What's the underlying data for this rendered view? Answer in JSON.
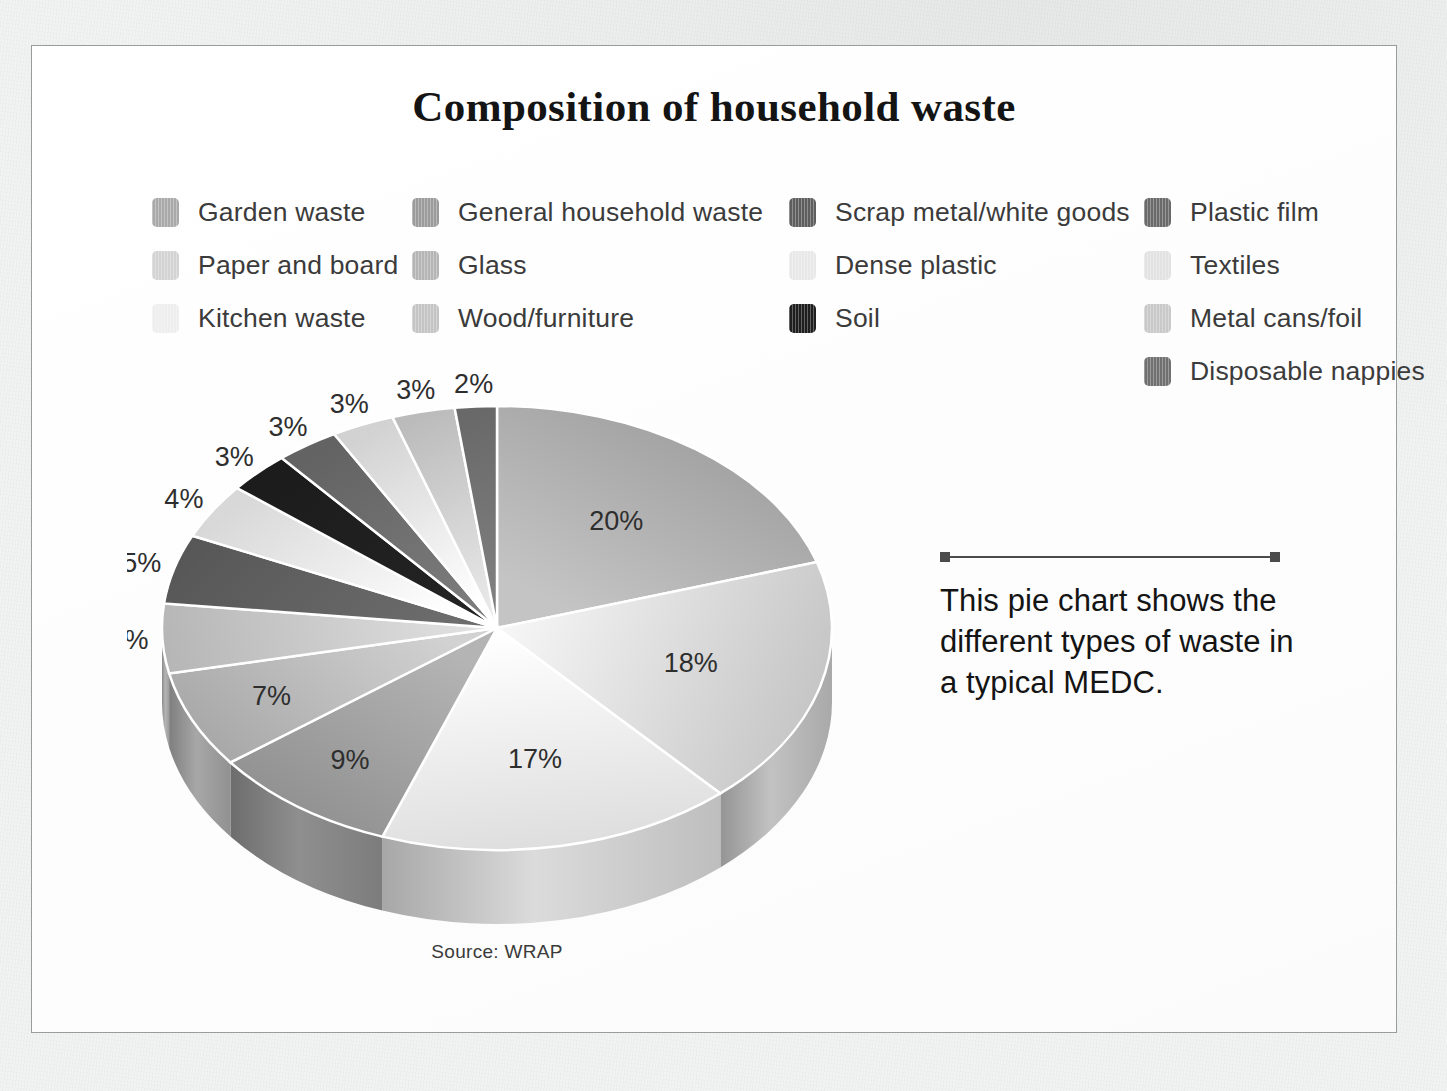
{
  "chart_title": "Composition of household waste",
  "source_note": "Source: WRAP",
  "annotation": {
    "text": "This pie chart shows the different types of waste in a typical MEDC."
  },
  "legend": {
    "columns": [
      {
        "items": [
          {
            "label": "Garden waste",
            "color": "#a9a9a9"
          },
          {
            "label": "Paper and board",
            "color": "#d3d3d3"
          },
          {
            "label": "Kitchen waste",
            "color": "#eeeeee"
          }
        ]
      },
      {
        "items": [
          {
            "label": "General household waste",
            "color": "#9b9b9b"
          },
          {
            "label": "Glass",
            "color": "#b5b5b5"
          },
          {
            "label": "Wood/furniture",
            "color": "#c4c4c4"
          }
        ]
      },
      {
        "items": [
          {
            "label": "Scrap metal/white goods",
            "color": "#5e5e5e"
          },
          {
            "label": "Dense plastic",
            "color": "#e8e8e8"
          },
          {
            "label": "Soil",
            "color": "#1e1e1e"
          }
        ]
      },
      {
        "items": [
          {
            "label": "Plastic film",
            "color": "#6a6a6a"
          },
          {
            "label": "Textiles",
            "color": "#e2e2e2"
          },
          {
            "label": "Metal cans/foil",
            "color": "#c9c9c9"
          },
          {
            "label": "Disposable nappies",
            "color": "#707070"
          }
        ]
      }
    ]
  },
  "chart_data": {
    "type": "pie",
    "title": "Composition of household waste",
    "units": "percent",
    "legend_position": "top",
    "three_d": true,
    "source": "Source: WRAP",
    "categories": [
      "Garden waste",
      "Paper and board",
      "Kitchen waste",
      "General household waste",
      "Glass",
      "Wood/furniture",
      "Scrap metal/white goods",
      "Dense plastic",
      "Soil",
      "Plastic film",
      "Textiles",
      "Metal cans/foil",
      "Disposable nappies"
    ],
    "values": [
      20,
      18,
      17,
      9,
      7,
      5,
      5,
      4,
      3,
      3,
      3,
      3,
      2
    ],
    "labels": [
      "20%",
      "18%",
      "17%",
      "9%",
      "7%",
      "5%",
      "5%",
      "4%",
      "3%",
      "3%",
      "3%",
      "3%",
      "2%"
    ],
    "colors": [
      "#a9a9a9",
      "#d3d3d3",
      "#eeeeee",
      "#9b9b9b",
      "#b5b5b5",
      "#c4c4c4",
      "#5e5e5e",
      "#e8e8e8",
      "#1e1e1e",
      "#6a6a6a",
      "#e2e2e2",
      "#c9c9c9",
      "#707070"
    ]
  }
}
